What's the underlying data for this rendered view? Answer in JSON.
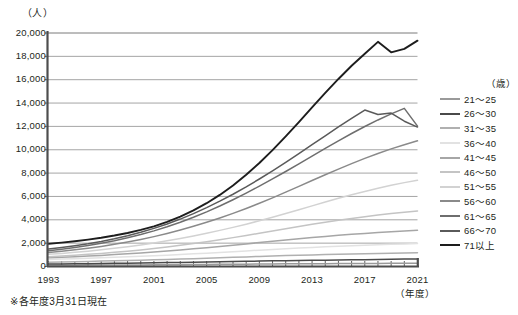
{
  "top_cut_text": "",
  "axis": {
    "y_unit": "（人）",
    "x_unit": "（年度）",
    "y_ticks": [
      "20,000",
      "18,000",
      "16,000",
      "14,000",
      "12,000",
      "10,000",
      "8,000",
      "6,000",
      "4,000",
      "2,000",
      "0"
    ],
    "x_ticks": [
      "1993",
      "1997",
      "2001",
      "2005",
      "2009",
      "2013",
      "2017",
      "2021"
    ]
  },
  "footnote": "※各年度3月31日現在",
  "legend": {
    "title": "（歳）",
    "items": [
      {
        "label": "21〜25",
        "color": "#9a9a9a"
      },
      {
        "label": "26〜30",
        "color": "#4a4a4a"
      },
      {
        "label": "31〜35",
        "color": "#b0b0b0"
      },
      {
        "label": "36〜40",
        "color": "#e2e2e2"
      },
      {
        "label": "41〜45",
        "color": "#a6a6a6"
      },
      {
        "label": "46〜50",
        "color": "#c4c4c4"
      },
      {
        "label": "51〜55",
        "color": "#d2d2d2"
      },
      {
        "label": "56〜60",
        "color": "#8a8a8a"
      },
      {
        "label": "61〜65",
        "color": "#6e6e6e"
      },
      {
        "label": "66〜70",
        "color": "#5a5a5a"
      },
      {
        "label": "71以上",
        "color": "#1d1d1d"
      }
    ]
  },
  "chart_data": {
    "type": "line",
    "title": "",
    "xlabel": "（年度）",
    "ylabel": "（人）",
    "ylim": [
      0,
      20000
    ],
    "ytick_interval": 2000,
    "grid": true,
    "legend_position": "right",
    "x": [
      1993,
      1994,
      1995,
      1996,
      1997,
      1998,
      1999,
      2000,
      2001,
      2002,
      2003,
      2004,
      2005,
      2006,
      2007,
      2008,
      2009,
      2010,
      2011,
      2012,
      2013,
      2014,
      2015,
      2016,
      2017,
      2018,
      2019,
      2020,
      2021
    ],
    "series": [
      {
        "name": "21〜25",
        "color": "#9a9a9a",
        "values": [
          60,
          65,
          70,
          75,
          80,
          85,
          90,
          95,
          100,
          105,
          110,
          120,
          130,
          140,
          150,
          160,
          170,
          180,
          185,
          190,
          195,
          200,
          205,
          210,
          215,
          220,
          225,
          230,
          235
        ]
      },
      {
        "name": "26〜30",
        "color": "#4a4a4a",
        "values": [
          170,
          180,
          190,
          200,
          215,
          230,
          245,
          260,
          275,
          290,
          305,
          320,
          340,
          360,
          380,
          400,
          420,
          440,
          455,
          470,
          485,
          500,
          515,
          530,
          545,
          560,
          575,
          590,
          610
        ]
      },
      {
        "name": "31〜35",
        "color": "#b0b0b0",
        "values": [
          330,
          350,
          370,
          395,
          420,
          445,
          470,
          500,
          530,
          560,
          595,
          630,
          665,
          700,
          740,
          780,
          820,
          855,
          890,
          920,
          950,
          980,
          1005,
          1030,
          1055,
          1080,
          1100,
          1120,
          1140
        ]
      },
      {
        "name": "36〜40",
        "color": "#e2e2e2",
        "values": [
          560,
          590,
          625,
          660,
          700,
          740,
          785,
          830,
          880,
          930,
          985,
          1040,
          1100,
          1160,
          1225,
          1290,
          1355,
          1420,
          1480,
          1535,
          1590,
          1640,
          1690,
          1735,
          1780,
          1820,
          1860,
          1895,
          1930
        ]
      },
      {
        "name": "41〜45",
        "color": "#a6a6a6",
        "values": [
          700,
          745,
          795,
          850,
          910,
          975,
          1045,
          1120,
          1200,
          1285,
          1375,
          1470,
          1570,
          1675,
          1785,
          1895,
          2010,
          2125,
          2235,
          2340,
          2440,
          2535,
          2625,
          2710,
          2790,
          2865,
          2935,
          3000,
          3060
        ]
      },
      {
        "name": "46〜50",
        "color": "#c4c4c4",
        "values": [
          800,
          860,
          925,
          1000,
          1080,
          1170,
          1270,
          1380,
          1500,
          1630,
          1770,
          1920,
          2080,
          2250,
          2430,
          2615,
          2805,
          3000,
          3195,
          3385,
          3570,
          3745,
          3910,
          4070,
          4220,
          4360,
          4490,
          4610,
          4720
        ]
      },
      {
        "name": "51〜55",
        "color": "#d2d2d2",
        "values": [
          1000,
          1080,
          1170,
          1270,
          1385,
          1510,
          1650,
          1805,
          1975,
          2160,
          2360,
          2575,
          2805,
          3050,
          3310,
          3585,
          3875,
          4180,
          4495,
          4820,
          5150,
          5475,
          5795,
          6100,
          6390,
          6660,
          6910,
          7140,
          7350
        ]
      },
      {
        "name": "56〜60",
        "color": "#8a8a8a",
        "values": [
          1150,
          1260,
          1385,
          1525,
          1680,
          1855,
          2050,
          2270,
          2515,
          2785,
          3080,
          3400,
          3745,
          4115,
          4510,
          4930,
          5375,
          5840,
          6325,
          6820,
          7320,
          7815,
          8300,
          8770,
          9220,
          9640,
          10030,
          10390,
          10720
        ]
      },
      {
        "name": "61〜65",
        "color": "#6e6e6e",
        "values": [
          1300,
          1430,
          1580,
          1750,
          1945,
          2165,
          2415,
          2695,
          3010,
          3360,
          3750,
          4175,
          4640,
          5140,
          5675,
          6240,
          6835,
          7455,
          8095,
          8750,
          9410,
          10070,
          10720,
          11350,
          11950,
          12510,
          13030,
          13500,
          11980
        ]
      },
      {
        "name": "66〜70",
        "color": "#5a5a5a",
        "values": [
          1450,
          1580,
          1730,
          1905,
          2105,
          2335,
          2595,
          2890,
          3225,
          3600,
          4020,
          4485,
          4995,
          5550,
          6145,
          6780,
          7450,
          8150,
          8880,
          9630,
          10390,
          11155,
          11910,
          12650,
          13360,
          12980,
          13100,
          12400,
          11900
        ]
      },
      {
        "name": "71以上",
        "color": "#1d1d1d",
        "values": [
          1900,
          2000,
          2120,
          2260,
          2420,
          2610,
          2830,
          3090,
          3400,
          3780,
          4230,
          4760,
          5380,
          6090,
          6900,
          7810,
          8820,
          9920,
          11100,
          12330,
          13580,
          14820,
          16020,
          17150,
          18180,
          19200,
          18300,
          18600,
          19300
        ]
      }
    ]
  }
}
